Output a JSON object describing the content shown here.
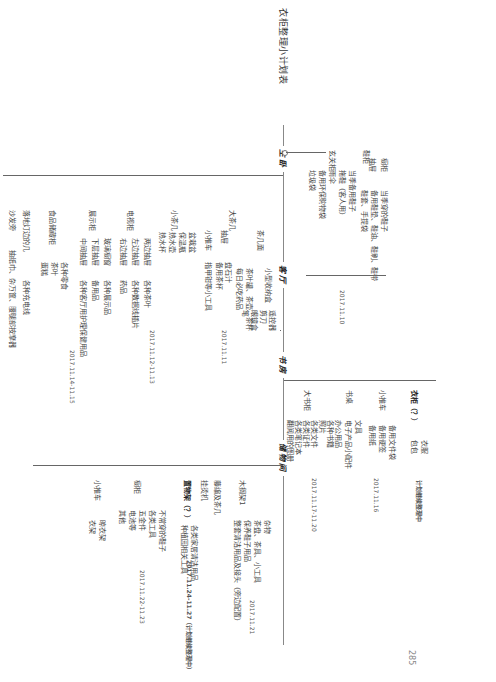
{
  "page": {
    "title": "衣柜整理小计划表",
    "page_number": "285",
    "orientation": "rotated 90deg"
  },
  "rooms": [
    {
      "name": "主卧",
      "date": "2017.11.10",
      "groups": [
        {
          "label": "鞋柜",
          "children": [
            {
              "label": "橱柜",
              "items": [
                "当季穿的鞋子"
              ]
            },
            {
              "label": "抽屉",
              "items": [
                "备用鞋垫、鞋油、鞋刷、鞋带",
                "鞋套、手提袋"
              ]
            }
          ]
        },
        {
          "label": "玄关柜",
          "children": [
            {
              "label": "",
              "items": [
                "当季备用鞋子",
                "拖鞋（客人用）",
                "雨伞",
                "备用环保购物袋",
                "垃圾袋"
              ]
            }
          ]
        }
      ]
    },
    {
      "name": "客厅",
      "groups": [
        {
          "label": "大茶几",
          "date": "2017.11.11",
          "children": [
            {
              "label": "茶几面",
              "items": [
                "茶叶罐、茶壶、茶杯",
                "每日必吃药品"
              ],
              "sub": {
                "label": "小型收纳盒",
                "items": [
                  "遥控器",
                  "剪刀",
                  "眼镜盒",
                  "笔"
                ]
              }
            },
            {
              "label": "抽屉",
              "items": [
                "盘石汁",
                "备用茶杯"
              ]
            },
            {
              "label": "小推车",
              "items": [
                "指甲钳等小工具"
              ]
            }
          ]
        },
        {
          "label": "小茶几",
          "date": "2017.11.12-11.13",
          "children": [
            {
              "label": "",
              "items": [
                "盆栽盆",
                "保温瓶",
                "热水壶",
                "热水杯"
              ]
            }
          ]
        },
        {
          "label": "电视柜",
          "children": [
            {
              "label": "两边抽屉",
              "items": [
                "各种茶叶"
              ]
            },
            {
              "label": "左边抽屉",
              "items": [
                "各种数据线插片"
              ]
            },
            {
              "label": "右边抽屉",
              "items": [
                "药品"
              ]
            }
          ]
        },
        {
          "label": "展示柜",
          "date": "2017.11.14-11.15",
          "children": [
            {
              "label": "玻璃橱窗",
              "items": [
                "各种展示品"
              ]
            },
            {
              "label": "下层抽屉",
              "items": [
                "备用品"
              ]
            },
            {
              "label": "中间抽屉",
              "items": [
                "各种客厅用护理保健用品"
              ]
            }
          ]
        },
        {
          "label": "食品储藏柜",
          "children": [
            {
              "label": "",
              "items": [
                "各种零食",
                "茶叶",
                "蛋糕"
              ]
            }
          ]
        },
        {
          "label": "落地灯边的几",
          "items": [
            "各种充电线"
          ]
        },
        {
          "label": "沙发旁",
          "items": [
            "抽纸巾、杂万筐、腰腿部按摩器"
          ]
        }
      ]
    },
    {
      "name": "书房",
      "groups": [
        {
          "label": "大书柜",
          "date": "2017.11.17-11.20",
          "children": [
            {
              "label": "",
              "items": [
                "各种书籍",
                "照片",
                "各类文件",
                "各类证件",
                "各类笔记本",
                "翻阅用的图册"
              ]
            }
          ]
        },
        {
          "label": "书桌",
          "date": "2017.11.16",
          "children": [
            {
              "label": "",
              "items": [
                "文具",
                "电子产品小配件",
                "办公用品"
              ]
            }
          ]
        },
        {
          "label": "小推车",
          "children": [
            {
              "label": "",
              "items": [
                "备用文件袋",
                "备用便签",
                "备用纸"
              ]
            }
          ]
        },
        {
          "label": "衣柜（？）",
          "date": "计划继续整理中",
          "children": [
            {
              "label": "",
              "items": [
                "衣服",
                "包包"
              ]
            }
          ]
        }
      ]
    },
    {
      "name": "储物间",
      "groups": [
        {
          "label": "木搁架1",
          "date": "2017.11.21",
          "children": [
            {
              "label": "",
              "items": [
                "杂物",
                "茶盘、茶具、小工具",
                "保养鞋子用品",
                "整套清洁用品及接头（旁边配置）"
              ]
            }
          ]
        },
        {
          "label": "藤编及茶几"
        },
        {
          "label": "挂烫机"
        },
        {
          "label": "置物架（？）",
          "date": "2017.11.24-11.27（计划继续整理中）",
          "children": [
            {
              "label": "",
              "items": [
                "各类家居清洁用品",
                "种植园相关工具"
              ]
            }
          ]
        },
        {
          "label": "橱柜",
          "date": "2017.11.22-11.23",
          "children": [
            {
              "label": "",
              "items": [
                "不常穿的鞋子",
                "各类工具",
                "五金件",
                "电池等",
                "其他"
              ]
            }
          ]
        },
        {
          "label": "小推车",
          "children": [
            {
              "label": "",
              "items": [
                "晾衣架",
                "衣架"
              ]
            }
          ]
        }
      ]
    }
  ]
}
